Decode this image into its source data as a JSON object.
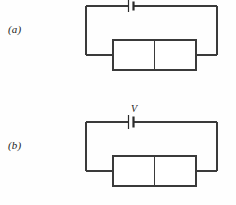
{
  "figure": {
    "background_color": "#fefefe",
    "line_color": "#3a3a3a",
    "text_color": "#1d1d1d"
  },
  "panels": [
    {
      "id": "a",
      "label": "(a)",
      "source": {
        "type": "battery-cell",
        "label": "",
        "has_label": false
      },
      "device": {
        "type": "pn-junction",
        "left_region": "p",
        "right_region": "n"
      }
    },
    {
      "id": "b",
      "label": "(b)",
      "source": {
        "type": "battery-cell",
        "label": "V",
        "has_label": true
      },
      "device": {
        "type": "pn-junction",
        "left_region": "p",
        "right_region": "n"
      }
    }
  ]
}
